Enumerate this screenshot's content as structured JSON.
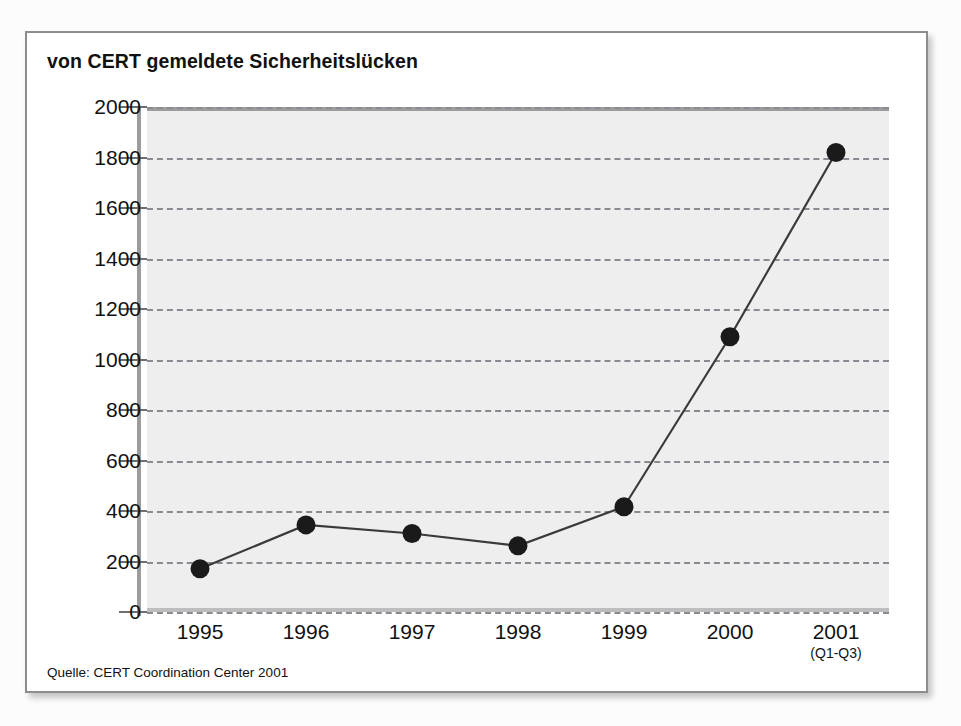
{
  "figure": {
    "title": "von CERT gemeldete Sicherheitslücken",
    "source_note": "Quelle: CERT Coordination Center 2001"
  },
  "colors": {
    "card_background": "#ffffff",
    "card_border": "#8d8d8d",
    "plot_background": "#eeeeee",
    "gridline": "#8a8a93",
    "series_line": "#3a3a3a",
    "marker": "#1a1a1a",
    "text": "#111111"
  },
  "chart_data": {
    "type": "line",
    "title": "von CERT gemeldete Sicherheitslücken",
    "xlabel": "",
    "ylabel": "",
    "categories": [
      "1995",
      "1996",
      "1997",
      "1998",
      "1999",
      "2000",
      "2001"
    ],
    "category_sublabels": [
      "",
      "",
      "",
      "",
      "",
      "",
      "(Q1-Q3)"
    ],
    "values": [
      171,
      345,
      311,
      262,
      417,
      1090,
      1820
    ],
    "ylim": [
      0,
      2000
    ],
    "yticks": [
      0,
      200,
      400,
      600,
      800,
      1000,
      1200,
      1400,
      1600,
      1800,
      2000
    ],
    "ytick_labels": [
      "0",
      "200",
      "400",
      "600",
      "800",
      "1000",
      "1200",
      "1400",
      "1600",
      "1800",
      "2000"
    ],
    "grid": true,
    "grid_style": "dashed",
    "legend": false,
    "markers": "filled-circle",
    "series": [
      {
        "name": "von CERT gemeldete Sicherheitslücken",
        "values": [
          171,
          345,
          311,
          262,
          417,
          1090,
          1820
        ]
      }
    ]
  },
  "background_bleed": [
    {
      "text": "Wir si",
      "x": 690,
      "y": 56,
      "size": 16
    },
    {
      "text": "Unternehmen mit anderen Anbietern für Internet verbinden, um e",
      "x": 180,
      "y": 160,
      "size": 18
    },
    {
      "text": "ter Systemkomponenten vergewissert, ob sie noch sicher sind, hat",
      "x": 175,
      "y": 190,
      "size": 18
    },
    {
      "text": "nur wenige Stunden, um die Lücke zu schließen. Am",
      "x": 200,
      "y": 218,
      "size": 18
    },
    {
      "text": "werden Sie man können",
      "x": 210,
      "y": 248,
      "size": 18
    },
    {
      "text": "V",
      "x": 470,
      "y": 330,
      "size": 18
    },
    {
      "text": "Sicherheit braucht die Unterstützung",
      "x": 260,
      "y": 372,
      "size": 20
    },
    {
      "text": "T",
      "x": 470,
      "y": 400,
      "size": 18
    },
    {
      "text": "Im Jahr",
      "x": 190,
      "y": 434,
      "size": 18
    },
    {
      "text": "2000",
      "x": 188,
      "y": 452,
      "size": 18
    },
    {
      "text": "der Sicherheit",
      "x": 410,
      "y": 468,
      "size": 18
    },
    {
      "text": "V",
      "x": 470,
      "y": 500,
      "size": 18
    },
    {
      "text": "Sicherheitsvorfalle gemeldet",
      "x": 300,
      "y": 536,
      "size": 18
    },
    {
      "text": "ten",
      "x": 770,
      "y": 560,
      "size": 18
    },
    {
      "text": "die",
      "x": 480,
      "y": 600,
      "size": 18
    }
  ]
}
